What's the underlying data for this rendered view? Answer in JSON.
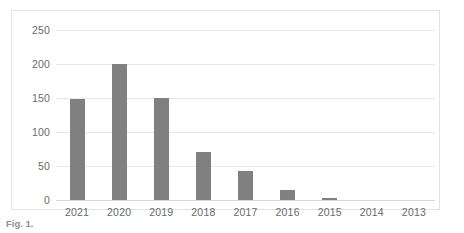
{
  "chart_data": {
    "type": "bar",
    "title": "",
    "xlabel": "",
    "ylabel": "",
    "categories": [
      "2021",
      "2020",
      "2019",
      "2018",
      "2017",
      "2016",
      "2015",
      "2014",
      "2013"
    ],
    "values": [
      148,
      200,
      150,
      70,
      42,
      15,
      3,
      0,
      0
    ],
    "series": [
      {
        "name": "Publications",
        "values": [
          148,
          200,
          150,
          70,
          42,
          15,
          3,
          0,
          0
        ]
      }
    ],
    "ylim": [
      0,
      250
    ],
    "ytick_values": [
      0,
      50,
      100,
      150,
      200,
      250
    ],
    "ytick_labels": [
      "0",
      "50",
      "100",
      "150",
      "200",
      "250"
    ],
    "grid": true,
    "grid_axis": "y",
    "legend": false,
    "legend_position": "none",
    "bar_color": "#808080",
    "gridline_color": "#e8e8e8",
    "frame_color": "#e3e3e3",
    "tick_label_color": "#6a6a6a",
    "background_color": "#ffffff",
    "annotations": []
  },
  "caption": {
    "label": "Fig. 1.",
    "text": ""
  }
}
